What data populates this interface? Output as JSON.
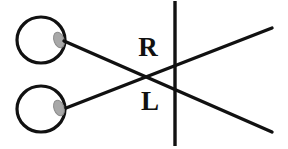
{
  "diagram": {
    "background_color": "#ffffff",
    "stroke_color": "#111111",
    "lens_fill_color": "#a8a8a8",
    "lens_stroke_color": "#8c8c8c",
    "labels": {
      "upper": "R",
      "lower": "L"
    },
    "eyes": [
      {
        "name": "upper-eye",
        "cx": 41,
        "cy": 40,
        "rx": 24,
        "ry": 23,
        "lens": {
          "cx": 59,
          "cy": 40,
          "rx": 5,
          "ry": 8,
          "rotate": -20
        }
      },
      {
        "name": "lower-eye",
        "cx": 41,
        "cy": 109,
        "rx": 24,
        "ry": 23,
        "lens": {
          "cx": 59,
          "cy": 108,
          "rx": 5,
          "ry": 8,
          "rotate": -20
        }
      }
    ],
    "sight_lines": [
      {
        "name": "upper-eye-sight-line",
        "x1": 64,
        "y1": 41,
        "x2": 272,
        "y2": 132
      },
      {
        "name": "lower-eye-sight-line",
        "x1": 66,
        "y1": 108,
        "x2": 272,
        "y2": 28
      }
    ],
    "vertical_line": {
      "name": "fixation-plane-line",
      "x1": 175,
      "y1": 1,
      "x2": 175,
      "y2": 146
    },
    "label_positions": {
      "upper": {
        "x": 148,
        "y": 56
      },
      "lower": {
        "x": 150,
        "y": 110
      }
    },
    "stroke_widths": {
      "eye_outline": 3.2,
      "sight_line": 3.4,
      "vertical_line": 3.4,
      "lens_outline": 1
    }
  }
}
